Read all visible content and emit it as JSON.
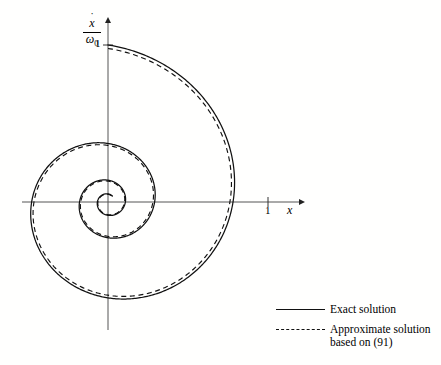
{
  "figure": {
    "background_color": "#fffffe",
    "line_color": "#111111",
    "axis_color": "#555555"
  },
  "axes": {
    "y_axis": {
      "numerator": "x",
      "numerator_accent": "˙",
      "denominator": "ω",
      "denominator_subscript": "0",
      "tick_label": "1"
    },
    "x_axis": {
      "label": "x",
      "tick_label": "1"
    }
  },
  "legend": {
    "entries": [
      {
        "style": "solid",
        "label": "Exact solution"
      },
      {
        "style": "dashed",
        "label": "Approximate solution\nbased on (91)"
      }
    ]
  },
  "chart_data": {
    "type": "line",
    "title": "",
    "subtitle": "",
    "xlabel": "x",
    "ylabel": "xdot/omega_0",
    "plot_kind": "phase-plane trajectory of a damped oscillator (logarithmic spiral)",
    "grid": false,
    "legend_position": "bottom-right",
    "xlim": [
      -1.0,
      1.4
    ],
    "ylim": [
      -1.1,
      1.15
    ],
    "x_ticks": [
      1
    ],
    "y_ticks": [
      1
    ],
    "origin_pixel": {
      "x": 108,
      "y": 202
    },
    "unit_pixels_per_x": 160,
    "unit_pixels_per_y": 157,
    "spiral_model": {
      "description": "r(theta) = r0 * exp(-b*theta), clockwise from start at (0,1)",
      "r0": 1.0,
      "decay_b": 0.157,
      "start_angle_deg": 90,
      "turns": 3.1,
      "direction": "clockwise"
    },
    "series": [
      {
        "name": "Exact solution",
        "style": "solid",
        "points": [
          [
            0.0,
            1.0
          ],
          [
            0.28,
            0.93
          ],
          [
            0.54,
            0.76
          ],
          [
            0.74,
            0.5
          ],
          [
            0.84,
            0.2
          ],
          [
            0.845,
            -0.1
          ],
          [
            0.75,
            -0.38
          ],
          [
            0.58,
            -0.58
          ],
          [
            0.34,
            -0.69
          ],
          [
            0.07,
            -0.7
          ],
          [
            -0.18,
            -0.61
          ],
          [
            -0.36,
            -0.43
          ],
          [
            -0.45,
            -0.2
          ],
          [
            -0.46,
            0.05
          ],
          [
            -0.39,
            0.26
          ],
          [
            -0.24,
            0.41
          ],
          [
            -0.06,
            0.47
          ],
          [
            0.12,
            0.44
          ],
          [
            0.26,
            0.32
          ],
          [
            0.33,
            0.15
          ],
          [
            0.33,
            -0.03
          ],
          [
            0.26,
            -0.18
          ],
          [
            0.14,
            -0.27
          ],
          [
            0.0,
            -0.28
          ],
          [
            -0.12,
            -0.23
          ],
          [
            -0.2,
            -0.12
          ],
          [
            -0.21,
            0.0
          ],
          [
            -0.17,
            0.11
          ],
          [
            -0.08,
            0.17
          ],
          [
            0.02,
            0.17
          ],
          [
            0.1,
            0.11
          ],
          [
            0.13,
            0.02
          ],
          [
            0.11,
            -0.06
          ],
          [
            0.05,
            -0.1
          ],
          [
            -0.02,
            -0.08
          ],
          [
            -0.06,
            -0.02
          ],
          [
            -0.04,
            0.03
          ],
          [
            0.0,
            0.04
          ],
          [
            0.02,
            0.0
          ],
          [
            0.0,
            0.0
          ]
        ]
      },
      {
        "name": "Approximate solution based on (91)",
        "style": "dashed",
        "points": [
          [
            0.0,
            1.0
          ],
          [
            0.27,
            0.92
          ],
          [
            0.53,
            0.74
          ],
          [
            0.72,
            0.48
          ],
          [
            0.82,
            0.19
          ],
          [
            0.82,
            -0.11
          ],
          [
            0.73,
            -0.37
          ],
          [
            0.56,
            -0.57
          ],
          [
            0.33,
            -0.67
          ],
          [
            0.07,
            -0.68
          ],
          [
            -0.17,
            -0.59
          ],
          [
            -0.35,
            -0.42
          ],
          [
            -0.44,
            -0.19
          ],
          [
            -0.44,
            0.05
          ],
          [
            -0.37,
            0.26
          ],
          [
            -0.23,
            0.4
          ],
          [
            -0.05,
            0.46
          ],
          [
            0.12,
            0.43
          ],
          [
            0.25,
            0.31
          ],
          [
            0.32,
            0.15
          ],
          [
            0.32,
            -0.03
          ],
          [
            0.25,
            -0.18
          ],
          [
            0.13,
            -0.26
          ],
          [
            0.0,
            -0.27
          ],
          [
            -0.11,
            -0.22
          ],
          [
            -0.19,
            -0.12
          ],
          [
            -0.2,
            0.0
          ],
          [
            -0.16,
            0.11
          ],
          [
            -0.07,
            0.16
          ],
          [
            0.02,
            0.16
          ],
          [
            0.09,
            0.11
          ],
          [
            0.12,
            0.02
          ],
          [
            0.1,
            -0.06
          ],
          [
            0.04,
            -0.09
          ],
          [
            -0.02,
            -0.07
          ],
          [
            -0.05,
            -0.02
          ],
          [
            -0.03,
            0.03
          ],
          [
            0.0,
            0.03
          ],
          [
            0.0,
            0.0
          ]
        ]
      }
    ]
  }
}
